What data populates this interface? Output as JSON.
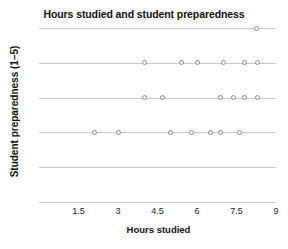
{
  "chart_data": {
    "type": "scatter",
    "title": "Hours studied and student preparedness",
    "xlabel": "Hours studied",
    "ylabel": "Student preparedness (1–5)",
    "xlim": [
      0,
      9
    ],
    "ylim": [
      0,
      5
    ],
    "grid": true,
    "legend": false,
    "xticks": [
      {
        "value": 1.5,
        "label": "1.5"
      },
      {
        "value": 3,
        "label": "3"
      },
      {
        "value": 4.5,
        "label": "4.5"
      },
      {
        "value": 6,
        "label": "6"
      },
      {
        "value": 7.5,
        "label": "7.5"
      },
      {
        "value": 9,
        "label": "9"
      }
    ],
    "yticks": [
      {
        "value": 5,
        "label": "5"
      },
      {
        "value": 4,
        "label": "4"
      },
      {
        "value": 3,
        "label": "3"
      },
      {
        "value": 2,
        "label": "2"
      },
      {
        "value": 1,
        "label": "1"
      },
      {
        "value": 0,
        "label": "0"
      }
    ],
    "marker": {
      "shape": "open-circle",
      "edge_color": "#8c8c8c",
      "fill_color": "#ffffff",
      "size": 5
    },
    "grid_color": "#c9c9c9",
    "points": [
      {
        "x": 2.1,
        "y": 2
      },
      {
        "x": 3.0,
        "y": 2
      },
      {
        "x": 5.0,
        "y": 2
      },
      {
        "x": 5.8,
        "y": 2
      },
      {
        "x": 6.5,
        "y": 2
      },
      {
        "x": 6.9,
        "y": 2
      },
      {
        "x": 7.6,
        "y": 2
      },
      {
        "x": 4.0,
        "y": 3
      },
      {
        "x": 4.7,
        "y": 3
      },
      {
        "x": 6.9,
        "y": 3
      },
      {
        "x": 7.4,
        "y": 3
      },
      {
        "x": 7.8,
        "y": 3
      },
      {
        "x": 8.3,
        "y": 3
      },
      {
        "x": 4.0,
        "y": 4
      },
      {
        "x": 5.4,
        "y": 4
      },
      {
        "x": 6.0,
        "y": 4
      },
      {
        "x": 7.0,
        "y": 4
      },
      {
        "x": 7.8,
        "y": 4
      },
      {
        "x": 8.3,
        "y": 4
      },
      {
        "x": 8.25,
        "y": 5
      }
    ]
  }
}
